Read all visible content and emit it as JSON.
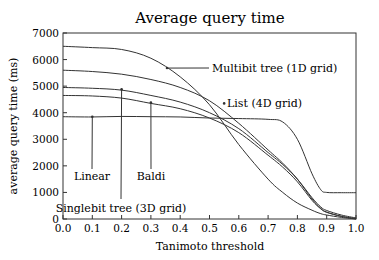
{
  "chart_data": {
    "type": "line",
    "title": "Average query time",
    "xlabel": "Tanimoto threshold",
    "ylabel": "average query time (ms)",
    "xlim": [
      0.0,
      1.0
    ],
    "ylim": [
      0,
      7000
    ],
    "grid": false,
    "legend": "inline annotations with arrows",
    "x_ticks": [
      "0.0",
      "0.1",
      "0.2",
      "0.3",
      "0.4",
      "0.5",
      "0.6",
      "0.7",
      "0.8",
      "0.9",
      "1.0"
    ],
    "y_ticks": [
      "0",
      "1000",
      "2000",
      "3000",
      "4000",
      "5000",
      "6000",
      "7000"
    ],
    "x": [
      0.0,
      0.1,
      0.2,
      0.3,
      0.4,
      0.5,
      0.6,
      0.7,
      0.75,
      0.8,
      0.85,
      0.88,
      0.9,
      0.95,
      1.0
    ],
    "series": [
      {
        "name": "Multibit tree (1D grid)",
        "values": [
          6500,
          6450,
          6380,
          6050,
          5350,
          4300,
          2800,
          1500,
          1000,
          600,
          330,
          200,
          150,
          60,
          0
        ]
      },
      {
        "name": "List (4D grid)",
        "values": [
          5600,
          5550,
          5450,
          5250,
          4950,
          4450,
          3600,
          2600,
          2100,
          1500,
          750,
          400,
          260,
          100,
          0
        ]
      },
      {
        "name": "Singlebit tree (3D grid)",
        "values": [
          4950,
          4920,
          4850,
          4650,
          4400,
          4000,
          3400,
          2500,
          2050,
          1500,
          800,
          450,
          320,
          150,
          40
        ]
      },
      {
        "name": "Baldi",
        "values": [
          4650,
          4630,
          4550,
          4350,
          4150,
          3800,
          3250,
          2400,
          1950,
          1400,
          700,
          380,
          250,
          100,
          20
        ]
      },
      {
        "name": "Linear",
        "values": [
          3850,
          3840,
          3860,
          3850,
          3840,
          3800,
          3780,
          3750,
          3650,
          3000,
          1700,
          1100,
          1000,
          990,
          990
        ]
      }
    ],
    "annotations": [
      {
        "text": "Multibit tree (1D grid)",
        "x": 0.355,
        "y": 5680
      },
      {
        "text": "List (4D grid)",
        "x": 0.55,
        "y": 4350
      },
      {
        "text": "Linear",
        "x": 0.1,
        "y": 3850
      },
      {
        "text": "Singlebit tree (3D grid)",
        "x": 0.2,
        "y": 4880
      },
      {
        "text": "Baldi",
        "x": 0.3,
        "y": 4380
      }
    ]
  }
}
